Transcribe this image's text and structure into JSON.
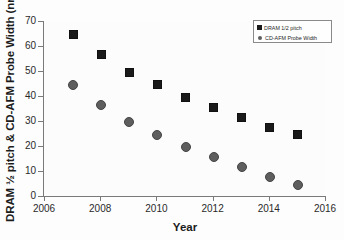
{
  "chart_data": {
    "type": "scatter",
    "title": "",
    "xlabel": "Year",
    "ylabel": "DRAM ½ pitch & CD-AFM Probe Width (nm)",
    "xlim": [
      2006,
      2016
    ],
    "ylim": [
      0,
      70
    ],
    "xticks": [
      "2006",
      "2008",
      "2010",
      "2012",
      "2014",
      "2016"
    ],
    "yticks": [
      "0",
      "10",
      "20",
      "30",
      "40",
      "50",
      "60",
      "70"
    ],
    "grid": false,
    "legend_position": "top-right",
    "x": [
      2007,
      2008,
      2009,
      2010,
      2011,
      2012,
      2013,
      2014,
      2015
    ],
    "series": [
      {
        "name": "DRAM 1/2 pitch",
        "marker": "square",
        "color": "#1a1a1a",
        "values": [
          65,
          57,
          50,
          45,
          40,
          36,
          32,
          28,
          25
        ]
      },
      {
        "name": "CD-AFM Probe Width",
        "marker": "circle",
        "color": "#5e5e5e",
        "values": [
          45,
          37,
          30,
          25,
          20,
          16,
          12,
          8,
          5
        ]
      }
    ]
  }
}
